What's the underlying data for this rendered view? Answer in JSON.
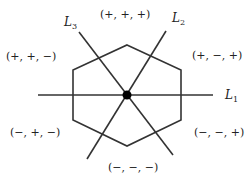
{
  "diagram": {
    "lines": [
      {
        "id": "L1",
        "label": "L",
        "sub": "1"
      },
      {
        "id": "L2",
        "label": "L",
        "sub": "2"
      },
      {
        "id": "L3",
        "label": "L",
        "sub": "3"
      }
    ],
    "regions": {
      "top": "(+, +, +)",
      "upper_right": "(+, −, +)",
      "upper_left": "(+, +, −)",
      "lower_left": "(−, +, −)",
      "lower_right": "(−, −, +)",
      "bottom": "(−, −, −)"
    },
    "colors": {
      "stroke": "#333333",
      "dot": "#000000",
      "text": "#222222"
    }
  }
}
